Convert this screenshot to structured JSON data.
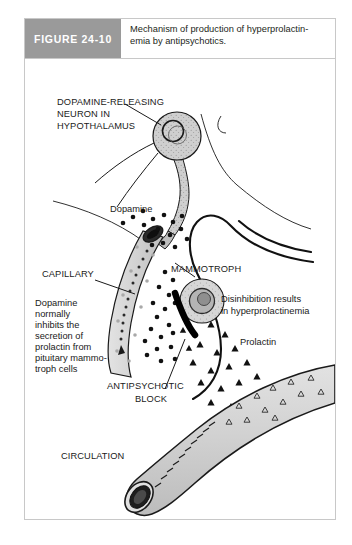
{
  "page": {
    "running_head": "",
    "background": "#ffffff"
  },
  "figure": {
    "tag": "FIGURE 24-10",
    "tag_bg": "#9a9a9a",
    "tag_color": "#ffffff",
    "caption_line1": "Mechanism of production of hyperprolactin-",
    "caption_line2": "emia by antipsychotics.",
    "border_color": "#c8c8c8"
  },
  "diagram": {
    "labels": {
      "neuron_l1": "DOPAMINE-RELEASING",
      "neuron_l2": "NEURON IN",
      "neuron_l3": "HYPOTHALAMUS",
      "dopamine": "Dopamine",
      "capillary": "CAPILLARY",
      "mammotroph": "MAMMOTROPH",
      "disinhibition_l1": "Disinhibition results",
      "disinhibition_l2": "in hyperprolactinemia",
      "prolactin": "Prolactin",
      "block_l1": "ANTIPSYCHOTIC",
      "block_l2": "BLOCK",
      "circulation": "CIRCULATION",
      "body_l1": "Dopamine",
      "body_l2": "normally",
      "body_l3": "inhibits the",
      "body_l4": "secretion of",
      "body_l5": "prolactin from",
      "body_l6": "pituitary mammo-",
      "body_l7": "troph cells"
    },
    "colors": {
      "tissue_fill": "#d4d4d4",
      "cell_fill": "#c9c9c9",
      "outline": "#1a1a1a",
      "dopamine_dot": "#111111",
      "prolactin_triangle": "#111111",
      "block_bar": "#000000",
      "vessel_fill": "#d0d0d0"
    },
    "elements": [
      {
        "name": "dopamine-neuron-soma",
        "type": "stippled-circle"
      },
      {
        "name": "neuron-axon-terminal",
        "type": "tapered-process"
      },
      {
        "name": "dopamine-particles",
        "type": "dot-cluster"
      },
      {
        "name": "capillary-vessel",
        "type": "curved-tube"
      },
      {
        "name": "mammotroph-cell",
        "type": "stippled-circle-with-nucleus"
      },
      {
        "name": "antipsychotic-block-bar",
        "type": "thick-black-bar"
      },
      {
        "name": "prolactin-particles",
        "type": "filled-triangles"
      },
      {
        "name": "circulation-vessel",
        "type": "large-cut-tube"
      },
      {
        "name": "circulating-prolactin",
        "type": "outlined-triangles"
      }
    ]
  }
}
